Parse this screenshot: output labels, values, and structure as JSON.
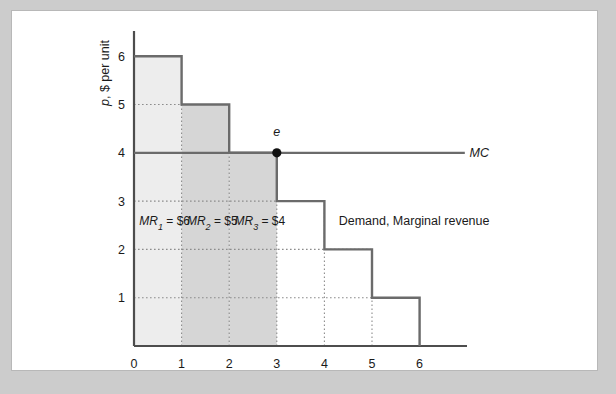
{
  "figure": {
    "background_color": "#cccccc",
    "panel_color": "#ffffff",
    "panel_border_color": "#b8b8b8"
  },
  "chart_data": {
    "type": "line",
    "title": "",
    "xlabel_prefix": "Q",
    "xlabel_suffix": ", Units per day",
    "ylabel_prefix": "p",
    "ylabel_suffix": ", $ per unit",
    "xlim": [
      0,
      6.6
    ],
    "ylim": [
      0,
      6.6
    ],
    "xticks": [
      0,
      1,
      2,
      3,
      4,
      5,
      6
    ],
    "xtick_labels": [
      "0",
      "1",
      "2",
      "3",
      "4",
      "5",
      "6"
    ],
    "yticks": [
      1,
      2,
      3,
      4,
      5,
      6
    ],
    "ytick_labels": [
      "1",
      "2",
      "3",
      "4",
      "5",
      "6"
    ],
    "grid": "dotted",
    "legend_position": "inline-annotation",
    "series": [
      {
        "name": "Demand, Marginal revenue",
        "type": "step",
        "label": "Demand, Marginal revenue",
        "color": "#6b6b6b",
        "steps": [
          {
            "q_from": 0,
            "q_to": 1,
            "price": 6
          },
          {
            "q_from": 1,
            "q_to": 2,
            "price": 5
          },
          {
            "q_from": 2,
            "q_to": 3,
            "price": 4
          },
          {
            "q_from": 3,
            "q_to": 4,
            "price": 3
          },
          {
            "q_from": 4,
            "q_to": 5,
            "price": 2
          },
          {
            "q_from": 5,
            "q_to": 6,
            "price": 1
          }
        ]
      },
      {
        "name": "MC",
        "type": "horizontal",
        "label": "MC",
        "color": "#6b6b6b",
        "value": 4,
        "x_from": 0,
        "x_to": 6.95
      }
    ],
    "points": [
      {
        "name": "e",
        "label": "e",
        "x": 3,
        "y": 4,
        "marker": "filled-circle",
        "color": "#111111"
      }
    ],
    "shaded_regions": [
      {
        "name": "mr1-region",
        "q_from": 0,
        "q_to": 1,
        "p_from": 0,
        "p_to": 6,
        "color": "#ededed"
      },
      {
        "name": "mr2-region",
        "q_from": 1,
        "q_to": 2,
        "p_from": 0,
        "p_to": 5,
        "color": "#d6d6d6"
      },
      {
        "name": "mr3-region",
        "q_from": 2,
        "q_to": 3,
        "p_from": 0,
        "p_to": 4,
        "color": "#d6d6d6"
      }
    ],
    "annotations": [
      {
        "name": "mr1-annotation",
        "base": "MR",
        "subscript": "1",
        "rest": " = $6",
        "x": 0.5,
        "y": 2.6
      },
      {
        "name": "mr2-annotation",
        "base": "MR",
        "subscript": "2",
        "rest": " = $5",
        "x": 1.5,
        "y": 2.6
      },
      {
        "name": "mr3-annotation",
        "base": "MR",
        "subscript": "3",
        "rest": " = $4",
        "x": 2.5,
        "y": 2.6
      },
      {
        "name": "demand-curve-label",
        "text": "Demand, Marginal revenue",
        "x": 4.3,
        "y": 2.6
      },
      {
        "name": "mc-curve-label",
        "text": "MC",
        "x": 7.05,
        "y": 4
      },
      {
        "name": "equilibrium-point-label",
        "text": "e",
        "x": 3,
        "y": 4.35
      }
    ]
  }
}
